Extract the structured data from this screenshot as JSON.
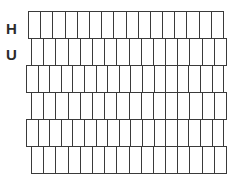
{
  "diagram": {
    "background_color": "#ffffff",
    "stroke_color": "#3a3a3a",
    "fill_color": "#ffffff",
    "labels": [
      {
        "text": "H",
        "name": "label-h"
      },
      {
        "text": "U",
        "name": "label-u"
      }
    ],
    "rows": [
      {
        "index": 1,
        "cells": 16,
        "left": 28,
        "top": 11,
        "width": 196,
        "height": 28,
        "offset": "flush"
      },
      {
        "index": 2,
        "cells": 16,
        "left": 31,
        "top": 38,
        "width": 196,
        "height": 28,
        "offset": "staggered"
      },
      {
        "index": 3,
        "cells": 17,
        "left": 26,
        "top": 65,
        "width": 198,
        "height": 28,
        "offset": "flush"
      },
      {
        "index": 4,
        "cells": 16,
        "left": 31,
        "top": 92,
        "width": 196,
        "height": 28,
        "offset": "staggered"
      },
      {
        "index": 5,
        "cells": 17,
        "left": 26,
        "top": 119,
        "width": 198,
        "height": 28,
        "offset": "flush"
      },
      {
        "index": 6,
        "cells": 16,
        "left": 31,
        "top": 146,
        "width": 196,
        "height": 28,
        "offset": "staggered"
      }
    ]
  }
}
